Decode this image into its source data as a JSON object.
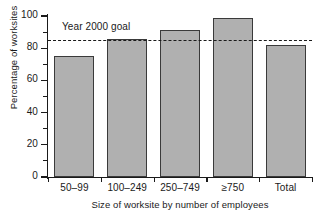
{
  "chart_data": {
    "type": "bar",
    "title": "",
    "categories": [
      "50–99",
      "100–249",
      "250–749",
      "≥750",
      "Total"
    ],
    "values": [
      75,
      86,
      91,
      99,
      82
    ],
    "xlabel": "Size of worksite by number of employees",
    "ylabel": "Percentage of worksites",
    "ylim": [
      0,
      100
    ],
    "ytick_labels": [
      "0",
      "20",
      "40",
      "60",
      "80",
      "100"
    ],
    "ytick_values": [
      0,
      20,
      40,
      60,
      80,
      100
    ],
    "yminor_values": [
      10,
      30,
      50,
      70,
      90
    ],
    "grid": false,
    "legend": "none",
    "bar_color": "#b0b0b0",
    "bar_edge_color": "#3a3a3a",
    "annotations": [
      {
        "label": "Year 2000 goal",
        "kind": "reference-line",
        "value": 85,
        "line_style": "dashed",
        "color": "#1a1a1a"
      }
    ]
  }
}
